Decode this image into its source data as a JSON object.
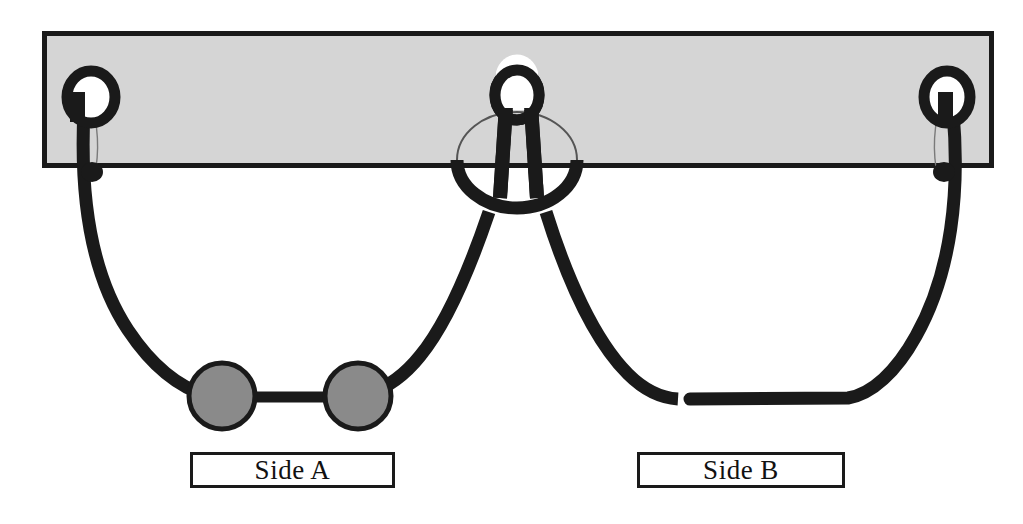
{
  "figure": {
    "background_color": "#ffffff"
  },
  "tissue_block": {
    "name": "tissue-block",
    "fill_color": "#d5d5d5",
    "stroke_color": "#1a1a1a",
    "x": 42,
    "y": 31,
    "width": 952,
    "height": 137,
    "stroke_width": 5
  },
  "rings": [
    {
      "name": "left-suture-ring",
      "cx": 91,
      "cy": 97,
      "rx": 29,
      "ry": 31,
      "stroke_color": "#1a1a1a",
      "stroke_width": 11,
      "fill_color": "#ffffff"
    },
    {
      "name": "center-suture-ring",
      "cx": 517,
      "cy": 95,
      "rx": 27,
      "ry": 30,
      "stroke_color": "#1a1a1a",
      "stroke_width": 11,
      "fill_color": "#ffffff"
    },
    {
      "name": "right-suture-ring",
      "cx": 947,
      "cy": 97,
      "rx": 28,
      "ry": 31,
      "stroke_color": "#1a1a1a",
      "stroke_width": 11,
      "fill_color": "#ffffff"
    }
  ],
  "center_loop": {
    "name": "center-loop-ellipse",
    "cx": 517,
    "cy": 160,
    "rx": 60,
    "ry": 48,
    "upper_stroke_color": "#555555",
    "upper_stroke_width": 2,
    "lower_stroke_color": "#1a1a1a",
    "lower_stroke_width": 13
  },
  "center_bars": [
    {
      "name": "center-bar-left",
      "x1": 506,
      "y1": 112,
      "x2": 500,
      "y2": 196,
      "stroke_width": 14
    },
    {
      "name": "center-bar-right",
      "x1": 531,
      "y1": 112,
      "x2": 537,
      "y2": 196,
      "stroke_width": 14
    }
  ],
  "suture_strands": [
    {
      "name": "left-strand-outer",
      "side": "A",
      "path": "M 84 110 C 80 190 88 270 128 330 C 152 366 180 388 208 396",
      "stroke_color": "#1a1a1a",
      "stroke_width": 13
    },
    {
      "name": "left-strand-inner",
      "side": "A",
      "path": "M 489 212 C 470 268 448 322 420 356 C 404 376 386 388 368 394",
      "stroke_color": "#1a1a1a",
      "stroke_width": 13
    },
    {
      "name": "right-strand-inner",
      "side": "B",
      "path": "M 546 212 C 566 276 594 340 628 374 C 646 392 662 398 678 399",
      "stroke_color": "#1a1a1a",
      "stroke_width": 13
    },
    {
      "name": "right-strand-outer",
      "side": "B",
      "path": "M 953 112 C 960 190 952 272 916 336 C 896 372 872 394 848 398 L 690 399",
      "stroke_color": "#1a1a1a",
      "stroke_width": 13
    }
  ],
  "knot_beads": {
    "name": "knot-beads",
    "fill_color": "#8a8a8a",
    "stroke_color": "#1a1a1a",
    "stroke_width": 5,
    "connector": {
      "x1": 252,
      "y1": 397,
      "x2": 330,
      "y2": 397,
      "stroke_width": 11
    },
    "items": [
      {
        "name": "knot-bead-left",
        "cx": 222,
        "cy": 396,
        "r": 33
      },
      {
        "name": "knot-bead-right",
        "cx": 358,
        "cy": 396,
        "r": 33
      }
    ]
  },
  "labels": {
    "side_a": {
      "name": "label-side-a",
      "text": "Side A",
      "border_color": "#1a1a1a",
      "background_color": "#ffffff"
    },
    "side_b": {
      "name": "label-side-b",
      "text": "Side B",
      "border_color": "#1a1a1a",
      "background_color": "#ffffff"
    }
  }
}
